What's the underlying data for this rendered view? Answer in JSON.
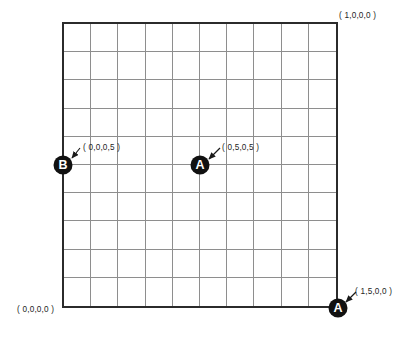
{
  "figure": {
    "type": "coordinate-grid-diagram",
    "background_color": "#ffffff",
    "border_color": "#2b2b2b",
    "gridline_color": "#8e8e8e",
    "marker_color": "#111111",
    "marker_text_color": "#ffffff",
    "grid": {
      "columns": 10,
      "rows": 10,
      "x_min": 0,
      "x_max": 1,
      "y_min": 0,
      "y_max": 1
    }
  },
  "corner_labels": [
    {
      "id": "top-right",
      "text": "( 1,0,0,0 )"
    },
    {
      "id": "bottom-left",
      "text": "( 0,0,0,0 )"
    }
  ],
  "markers": [
    {
      "id": "marker-a-center",
      "letter": "A",
      "label": "( 0,5,0,5 )",
      "grid_x": 0.5,
      "grid_y": 0.5
    },
    {
      "id": "marker-b-left",
      "letter": "B",
      "label": "( 0,0,0,5 )",
      "grid_x": 0.0,
      "grid_y": 0.5
    },
    {
      "id": "marker-a-corner",
      "letter": "A",
      "label": "( 1,5,0,0 )",
      "grid_x": 1.0,
      "grid_y": 0.0
    }
  ]
}
